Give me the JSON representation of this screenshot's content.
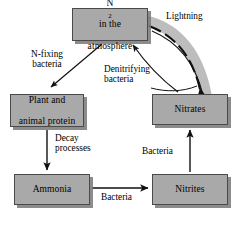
{
  "diagram": {
    "palette": {
      "box_fill": "#a9a9a9",
      "box_border": "#4a4a4a",
      "box_shadow": "#787878",
      "arrow": "#111111",
      "lightning_band": "#b8b8b8",
      "background": "#ffffff"
    },
    "nodes": [
      {
        "id": "atmosphere",
        "line1": "N",
        "sub": "2",
        "line1b": " in the",
        "line2": "atmosphere"
      },
      {
        "id": "plant",
        "line1": "Plant and",
        "line2": "animal protein"
      },
      {
        "id": "nitrates",
        "line1": "Nitrates"
      },
      {
        "id": "ammonia",
        "line1": "Ammonia"
      },
      {
        "id": "nitrites",
        "line1": "Nitrites"
      }
    ],
    "labels": {
      "lightning": "Lightning",
      "n_fixing_line1": "N-fixing",
      "n_fixing_line2": "bacteria",
      "denitrifying_line1": "Denitrifying",
      "denitrifying_line2": "bacteria",
      "decay_line1": "Decay",
      "decay_line2": "processes",
      "bacteria_nitrite_to_nitrate": "Bacteria",
      "bacteria_ammonia_to_nitrite": "Bacteria"
    }
  }
}
